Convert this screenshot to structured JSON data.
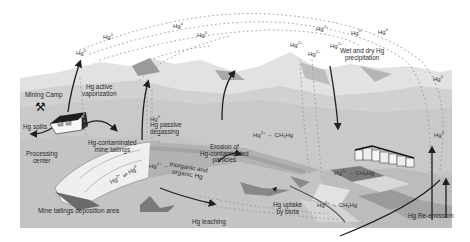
{
  "diagram": {
    "color_scheme": "grayscale",
    "colors": {
      "sky": "#ffffff",
      "far_mountains": "#d9d9d9",
      "mid_hills": "#c6c6c6",
      "ground": "#cfcfcf",
      "dark_ground": "#8c8c8c",
      "tailings": "#ececec",
      "arrow": "#1f1f1f",
      "dots": "#9a9a9a"
    },
    "labels": {
      "mining_camp": "Mining Camp",
      "hg_spills": "Hg spills",
      "processing_center_1": "Processing",
      "processing_center_2": "center",
      "active_vapor_1": "Hg active",
      "active_vapor_2": "vaporization",
      "contaminated_tailings_1": "Hg-contaminated",
      "contaminated_tailings_2": "mine tailings",
      "tailings_deposition": "Mine tailings deposition area",
      "passive_degas_1": "Hg passive",
      "passive_degas_2": "degassing",
      "inorganic_organic_1": "Inorganic and",
      "inorganic_organic_2": "organic Hg",
      "erosion_1": "Erosion of",
      "erosion_2": "Hg-contaminated",
      "erosion_3": "particles",
      "leaching": "Hg leaching",
      "uptake_1": "Hg uptake",
      "uptake_2": "by biota",
      "precip_1": "Wet and dry Hg",
      "precip_2": "precipitation",
      "reemission": "Hg Re-emission"
    },
    "species": {
      "hg0": "Hg",
      "hg0_sup": "0",
      "hg2": "Hg",
      "hg2_sup": "2+",
      "arrow_right": "→",
      "equilibrium": "⇌",
      "methyl": "CH",
      "methyl_sub": "3",
      "methyl_hg": "Hg"
    },
    "icons": {
      "pickaxes": "⚒"
    }
  }
}
